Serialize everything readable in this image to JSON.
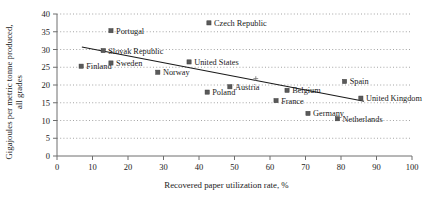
{
  "chart_data": {
    "type": "scatter",
    "title": "",
    "xlabel": "Recovered paper utilization rate, %",
    "ylabel": "Gigajoules per metric tonne produced, all grades",
    "ylabel_line1": "Gigajoules per metric tonne produced,",
    "ylabel_line2": "all grades",
    "xlim": [
      0,
      100
    ],
    "ylim": [
      0,
      40
    ],
    "xticks": [
      0,
      10,
      20,
      30,
      40,
      50,
      60,
      70,
      80,
      90,
      100
    ],
    "yticks": [
      0,
      5,
      10,
      15,
      20,
      25,
      30,
      35,
      40
    ],
    "xtick_labels": [
      "0",
      "10",
      "20",
      "30",
      "40",
      "50",
      "60",
      "70",
      "80",
      "90",
      "100"
    ],
    "ytick_labels": [
      "0",
      "5",
      "10",
      "15",
      "20",
      "25",
      "30",
      "35",
      "40"
    ],
    "grid": true,
    "grid_axis": "y",
    "legend": "none",
    "marker_color": "#5a5a5a",
    "trendline_color": "#1a1a1a",
    "points": [
      {
        "label": "Finland",
        "x": 6.8,
        "y": 25.3,
        "label_pos": "right"
      },
      {
        "label": "Portugal",
        "x": 15.2,
        "y": 35.3,
        "label_pos": "right"
      },
      {
        "label": "Slovak Republic",
        "x": 13.0,
        "y": 29.7,
        "label_pos": "right"
      },
      {
        "label": "Sweden",
        "x": 15.2,
        "y": 26.2,
        "label_pos": "right"
      },
      {
        "label": "Norway",
        "x": 28.4,
        "y": 23.6,
        "label_pos": "right"
      },
      {
        "label": "United States",
        "x": 37.2,
        "y": 26.5,
        "label_pos": "right"
      },
      {
        "label": "Czech Republic",
        "x": 42.8,
        "y": 37.5,
        "label_pos": "right"
      },
      {
        "label": "Poland",
        "x": 42.3,
        "y": 18.0,
        "label_pos": "right"
      },
      {
        "label": "Austria",
        "x": 48.7,
        "y": 19.5,
        "label_pos": "right"
      },
      {
        "label": "France",
        "x": 61.7,
        "y": 15.6,
        "label_pos": "right"
      },
      {
        "label": "Belgium",
        "x": 64.8,
        "y": 18.5,
        "label_pos": "right"
      },
      {
        "label": "Germany",
        "x": 70.7,
        "y": 12.0,
        "label_pos": "right"
      },
      {
        "label": "Netherlands",
        "x": 79.0,
        "y": 10.5,
        "label_pos": "right"
      },
      {
        "label": "Spain",
        "x": 81.0,
        "y": 21.0,
        "label_pos": "right"
      },
      {
        "label": "United Kingdom",
        "x": 85.6,
        "y": 16.3,
        "label_pos": "right"
      }
    ],
    "trendline": {
      "x0": 7.0,
      "y0": 30.7,
      "x1": 86.5,
      "y1": 15.4
    },
    "annotations": [
      {
        "symbol": "+",
        "x": 56.0,
        "y": 21.8
      }
    ]
  }
}
